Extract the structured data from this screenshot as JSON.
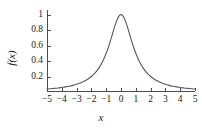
{
  "chart_data": {
    "type": "line",
    "title": "",
    "xlabel": "x",
    "ylabel": "f(x)",
    "xlim": [
      -5,
      5
    ],
    "ylim": [
      0,
      1.06
    ],
    "grid": false,
    "legend": null,
    "line_color": "#595959",
    "x_ticks": [
      -5,
      -4,
      -3,
      -2,
      -1,
      0,
      1,
      2,
      3,
      4,
      5
    ],
    "x_tick_labels": [
      "−5",
      "−4",
      "−3",
      "−2",
      "−1",
      "0",
      "1",
      "2",
      "3",
      "4",
      "5"
    ],
    "y_ticks": [
      0.2,
      0.4,
      0.6,
      0.8,
      1
    ],
    "y_tick_labels": [
      "0.2",
      "0.4",
      "0.6",
      "0.8",
      "1"
    ],
    "series": [
      {
        "name": "f(x)",
        "x": [
          -5,
          -4.75,
          -4.5,
          -4.25,
          -4,
          -3.75,
          -3.5,
          -3.25,
          -3,
          -2.75,
          -2.5,
          -2.25,
          -2,
          -1.75,
          -1.5,
          -1.25,
          -1,
          -0.875,
          -0.75,
          -0.625,
          -0.5,
          -0.375,
          -0.25,
          -0.125,
          0,
          0.125,
          0.25,
          0.375,
          0.5,
          0.625,
          0.75,
          0.875,
          1,
          1.25,
          1.5,
          1.75,
          2,
          2.25,
          2.5,
          2.75,
          3,
          3.25,
          3.5,
          3.75,
          4,
          4.25,
          4.5,
          4.75,
          5
        ],
        "y": [
          0.038,
          0.042,
          0.047,
          0.052,
          0.059,
          0.066,
          0.075,
          0.086,
          0.1,
          0.117,
          0.138,
          0.165,
          0.2,
          0.246,
          0.308,
          0.39,
          0.5,
          0.566,
          0.64,
          0.719,
          0.8,
          0.877,
          0.941,
          0.985,
          1,
          0.985,
          0.941,
          0.877,
          0.8,
          0.719,
          0.64,
          0.566,
          0.5,
          0.39,
          0.308,
          0.246,
          0.2,
          0.165,
          0.138,
          0.117,
          0.1,
          0.086,
          0.075,
          0.066,
          0.059,
          0.052,
          0.047,
          0.042,
          0.038
        ]
      }
    ]
  }
}
